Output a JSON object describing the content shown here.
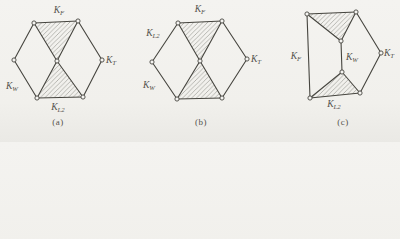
{
  "figure": {
    "line_color": "#46453f",
    "hatch_color": "#a2a29d",
    "label_color": "#54524c",
    "vertex_fill": "#f5f4f1",
    "diagrams": [
      {
        "id": "a",
        "caption": "(a)",
        "caption_x": 58,
        "vertices": [
          {
            "id": "L",
            "x": 14,
            "y": 60
          },
          {
            "id": "TL",
            "x": 34,
            "y": 23
          },
          {
            "id": "TR",
            "x": 78,
            "y": 21
          },
          {
            "id": "R",
            "x": 102,
            "y": 60
          },
          {
            "id": "BR",
            "x": 83,
            "y": 97
          },
          {
            "id": "BL",
            "x": 37,
            "y": 98
          },
          {
            "id": "C",
            "x": 57,
            "y": 61
          }
        ],
        "edges": [
          [
            "L",
            "TL"
          ],
          [
            "TL",
            "TR"
          ],
          [
            "TR",
            "R"
          ],
          [
            "R",
            "BR"
          ],
          [
            "BR",
            "BL"
          ],
          [
            "BL",
            "L"
          ],
          [
            "C",
            "TL"
          ],
          [
            "C",
            "TR"
          ],
          [
            "C",
            "BL"
          ],
          [
            "C",
            "BR"
          ]
        ],
        "hatched_faces": [
          [
            "TL",
            "TR",
            "C"
          ],
          [
            "BL",
            "BR",
            "C"
          ]
        ],
        "labels": [
          {
            "main": "K",
            "sub": "F",
            "x": 59,
            "y": 13,
            "anchor": "middle"
          },
          {
            "main": "K",
            "sub": "T",
            "x": 106,
            "y": 63,
            "anchor": "start"
          },
          {
            "main": "K",
            "sub": "W",
            "x": 6,
            "y": 89,
            "anchor": "start"
          },
          {
            "main": "K",
            "sub": "L2",
            "x": 58,
            "y": 110,
            "anchor": "middle"
          }
        ]
      },
      {
        "id": "b",
        "caption": "(b)",
        "caption_x": 201,
        "vertices": [
          {
            "id": "L",
            "x": 152,
            "y": 62
          },
          {
            "id": "TL",
            "x": 178,
            "y": 23
          },
          {
            "id": "TR",
            "x": 222,
            "y": 21
          },
          {
            "id": "R",
            "x": 247,
            "y": 59
          },
          {
            "id": "BR",
            "x": 222,
            "y": 98
          },
          {
            "id": "BL",
            "x": 177,
            "y": 99
          },
          {
            "id": "C",
            "x": 200,
            "y": 61
          }
        ],
        "edges": [
          [
            "L",
            "TL"
          ],
          [
            "TL",
            "TR"
          ],
          [
            "TR",
            "R"
          ],
          [
            "R",
            "BR"
          ],
          [
            "BR",
            "BL"
          ],
          [
            "BL",
            "L"
          ],
          [
            "C",
            "TL"
          ],
          [
            "C",
            "TR"
          ],
          [
            "C",
            "BL"
          ],
          [
            "C",
            "BR"
          ]
        ],
        "hatched_faces": [
          [
            "TL",
            "TR",
            "C"
          ],
          [
            "BL",
            "BR",
            "C"
          ]
        ],
        "labels": [
          {
            "main": "K",
            "sub": "F",
            "x": 200,
            "y": 12,
            "anchor": "middle"
          },
          {
            "main": "K",
            "sub": "L2",
            "x": 153,
            "y": 36,
            "anchor": "middle"
          },
          {
            "main": "K",
            "sub": "W",
            "x": 143,
            "y": 88,
            "anchor": "start"
          },
          {
            "main": "K",
            "sub": "T",
            "x": 251,
            "y": 62,
            "anchor": "start"
          }
        ]
      },
      {
        "id": "c",
        "caption": "(c)",
        "caption_x": 343,
        "vertices": [
          {
            "id": "TL",
            "x": 307,
            "y": 14
          },
          {
            "id": "TR",
            "x": 356,
            "y": 12
          },
          {
            "id": "MT",
            "x": 341,
            "y": 41
          },
          {
            "id": "R",
            "x": 381,
            "y": 53
          },
          {
            "id": "MB",
            "x": 342,
            "y": 72
          },
          {
            "id": "BR",
            "x": 360,
            "y": 93
          },
          {
            "id": "BL",
            "x": 310,
            "y": 98
          }
        ],
        "edges": [
          [
            "TL",
            "TR"
          ],
          [
            "TL",
            "MT"
          ],
          [
            "TR",
            "MT"
          ],
          [
            "MT",
            "MB"
          ],
          [
            "MB",
            "BL"
          ],
          [
            "MB",
            "BR"
          ],
          [
            "BL",
            "BR"
          ],
          [
            "TL",
            "BL"
          ],
          [
            "TR",
            "R"
          ],
          [
            "R",
            "BR"
          ]
        ],
        "hatched_faces": [
          [
            "TL",
            "TR",
            "MT"
          ],
          [
            "MB",
            "BL",
            "BR"
          ]
        ],
        "labels": [
          {
            "main": "K",
            "sub": "F",
            "x": 296,
            "y": 59,
            "anchor": "middle"
          },
          {
            "main": "K",
            "sub": "W",
            "x": 346,
            "y": 60,
            "anchor": "start"
          },
          {
            "main": "K",
            "sub": "T",
            "x": 384,
            "y": 56,
            "anchor": "start"
          },
          {
            "main": "K",
            "sub": "L2",
            "x": 334,
            "y": 107,
            "anchor": "middle"
          }
        ]
      }
    ]
  }
}
